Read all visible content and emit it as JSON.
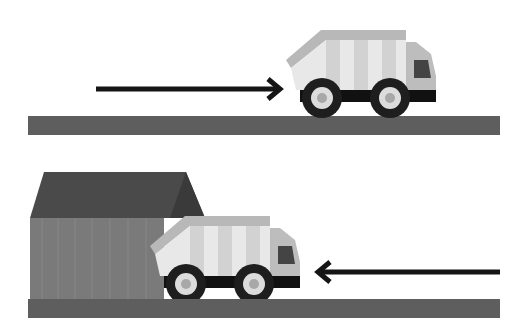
{
  "scene": {
    "description": "Garbage truck driving right, then truck backing into a garage",
    "colors": {
      "road": "#5e5e5e",
      "arrow": "#151515",
      "truck_body": "#e8e8e8",
      "truck_stripe": "#cfcfcf",
      "truck_top": "#b8b8b8",
      "cab": "#bdbdbd",
      "window": "#444444",
      "chassis": "#111111",
      "tire": "#1e1e1e",
      "hub": "#dcdcdc",
      "hub_center": "#a8a8a8",
      "garage_roof": "#4a4a4a",
      "garage_wall": "#7a7a7a"
    }
  },
  "panels": [
    {
      "name": "top",
      "arrow_direction": "right"
    },
    {
      "name": "bottom",
      "arrow_direction": "left"
    }
  ]
}
